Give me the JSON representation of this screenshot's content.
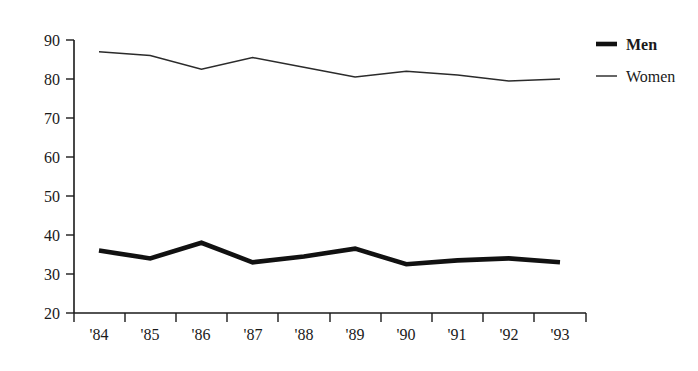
{
  "chart_data": {
    "type": "line",
    "title": "",
    "subtitle": "",
    "xlabel": "",
    "ylabel": "",
    "categories": [
      "'84",
      "'85",
      "'86",
      "'87",
      "'88",
      "'89",
      "'90",
      "'91",
      "'92",
      "'93"
    ],
    "series": [
      {
        "name": "Men",
        "values": [
          36,
          34,
          38,
          33,
          34.5,
          36.5,
          32.5,
          33.5,
          34,
          33
        ],
        "style": "thick-bold-line",
        "color": "#111111"
      },
      {
        "name": "Women",
        "values": [
          87,
          86,
          82.5,
          85.5,
          83,
          80.5,
          82,
          81,
          79.5,
          80
        ],
        "style": "thin-line",
        "color": "#2b2b2b"
      }
    ],
    "ylim": [
      20,
      90
    ],
    "yticks": [
      20,
      30,
      40,
      50,
      60,
      70,
      80,
      90
    ],
    "ytick_labels": [
      "20",
      "30",
      "40",
      "50",
      "60",
      "70",
      "80",
      "90"
    ],
    "xtick_labels": [
      "'84",
      "'85",
      "'86",
      "'87",
      "'88",
      "'89",
      "'90",
      "'91",
      "'92",
      "'93"
    ],
    "grid": false,
    "legend_position": "top-right",
    "legend_entries": [
      "Men",
      "Women"
    ]
  },
  "axes": {
    "y_axis_name": "y-axis",
    "x_axis_name": "x-axis"
  },
  "legend": {
    "men_label": "Men",
    "women_label": "Women"
  }
}
